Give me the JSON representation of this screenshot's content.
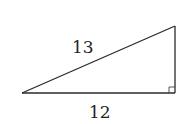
{
  "diagram": {
    "type": "right-triangle",
    "hypotenuse_label": "13",
    "base_label": "12",
    "right_angle_marker": true,
    "vertices": {
      "left": [
        22,
        93
      ],
      "bottom_right": [
        175,
        93
      ],
      "top_right": [
        175,
        26
      ]
    },
    "colors": {
      "stroke": "#2a2a2a",
      "text": "#222222",
      "background": "#ffffff"
    }
  }
}
